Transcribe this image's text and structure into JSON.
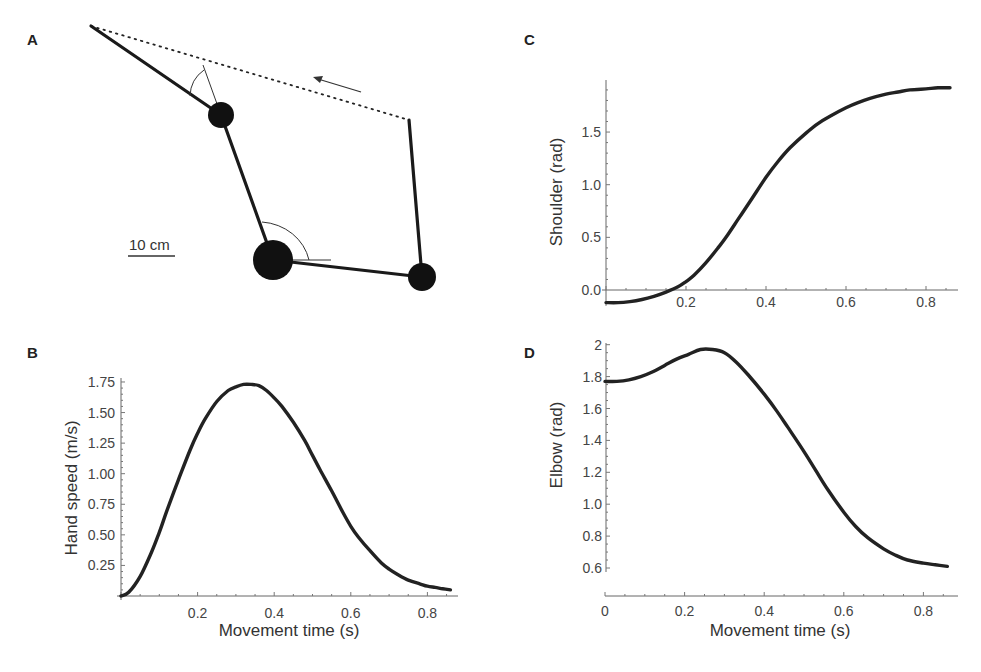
{
  "figure": {
    "panels": {
      "A": {
        "label": "A",
        "scale_bar_label": "10 cm",
        "hand_start": [
          409,
          120
        ],
        "hand_end": [
          91,
          26
        ],
        "initial_arm": {
          "shoulder": [
            273,
            260
          ],
          "elbow": [
            422,
            277
          ],
          "hand": [
            409,
            120
          ]
        },
        "final_arm": {
          "shoulder": [
            273,
            260
          ],
          "elbow": [
            221,
            115
          ],
          "hand": [
            91,
            26
          ]
        },
        "movement_arrow": {
          "from": [
            361,
            92
          ],
          "to": [
            314,
            78
          ]
        },
        "joint_radii": {
          "shoulder": 20,
          "elbow_final": 13,
          "elbow_initial": 14
        }
      },
      "B": {
        "label": "B"
      },
      "C": {
        "label": "C"
      },
      "D": {
        "label": "D"
      }
    }
  },
  "chart_data": [
    {
      "panel": "A",
      "type": "diagram",
      "title": "Two-link arm reaching movement",
      "annotations": [
        "10 cm scale bar",
        "dotted hand path",
        "arrow indicating movement direction",
        "shoulder angle arc",
        "elbow angle arc"
      ]
    },
    {
      "panel": "B",
      "type": "line",
      "title": "",
      "xlabel": "Movement time (s)",
      "ylabel": "Hand speed (m/s)",
      "xticks": [
        "0.2",
        "0.4",
        "0.6",
        "0.8"
      ],
      "yticks": [
        "0.25",
        "0.50",
        "0.75",
        "1.00",
        "1.25",
        "1.50",
        "1.75"
      ],
      "xlim": [
        0,
        0.88
      ],
      "ylim": [
        0,
        1.75
      ],
      "grid": false,
      "series": [
        {
          "name": "Hand speed",
          "x": [
            0,
            0.02,
            0.05,
            0.08,
            0.1,
            0.12,
            0.15,
            0.18,
            0.2,
            0.22,
            0.25,
            0.28,
            0.3,
            0.32,
            0.34,
            0.36,
            0.38,
            0.4,
            0.42,
            0.45,
            0.48,
            0.5,
            0.52,
            0.55,
            0.58,
            0.6,
            0.62,
            0.65,
            0.68,
            0.7,
            0.72,
            0.75,
            0.78,
            0.8,
            0.82,
            0.84,
            0.86
          ],
          "values": [
            0,
            0.03,
            0.16,
            0.36,
            0.52,
            0.7,
            0.95,
            1.19,
            1.33,
            1.45,
            1.59,
            1.68,
            1.71,
            1.73,
            1.73,
            1.72,
            1.68,
            1.62,
            1.55,
            1.42,
            1.27,
            1.15,
            1.03,
            0.86,
            0.68,
            0.57,
            0.48,
            0.37,
            0.27,
            0.22,
            0.18,
            0.13,
            0.1,
            0.08,
            0.07,
            0.06,
            0.05
          ]
        }
      ]
    },
    {
      "panel": "C",
      "type": "line",
      "title": "",
      "xlabel": "",
      "ylabel": "Shoulder (rad)",
      "xticks": [
        "0.2",
        "0.4",
        "0.6",
        "0.8"
      ],
      "yticks": [
        "0.0",
        "0.5",
        "1.0",
        "1.5"
      ],
      "xlim": [
        0,
        0.88
      ],
      "ylim": [
        -0.15,
        2.0
      ],
      "grid": false,
      "series": [
        {
          "name": "Shoulder angle",
          "x": [
            0,
            0.03,
            0.06,
            0.09,
            0.12,
            0.15,
            0.18,
            0.2,
            0.22,
            0.25,
            0.28,
            0.3,
            0.33,
            0.36,
            0.4,
            0.43,
            0.46,
            0.5,
            0.53,
            0.56,
            0.6,
            0.63,
            0.66,
            0.7,
            0.73,
            0.76,
            0.8,
            0.83,
            0.86
          ],
          "values": [
            -0.12,
            -0.12,
            -0.11,
            -0.09,
            -0.06,
            -0.02,
            0.03,
            0.08,
            0.14,
            0.26,
            0.4,
            0.5,
            0.67,
            0.84,
            1.07,
            1.22,
            1.35,
            1.49,
            1.58,
            1.65,
            1.73,
            1.78,
            1.82,
            1.86,
            1.88,
            1.9,
            1.91,
            1.92,
            1.92
          ]
        }
      ]
    },
    {
      "panel": "D",
      "type": "line",
      "title": "",
      "xlabel": "Movement time (s)",
      "ylabel": "Elbow (rad)",
      "xticks": [
        "0",
        "0.2",
        "0.4",
        "0.6",
        "0.8"
      ],
      "yticks": [
        "0.6",
        "0.8",
        "1.0",
        "1.2",
        "1.4",
        "1.6",
        "1.8",
        "2"
      ],
      "xlim": [
        0,
        0.88
      ],
      "ylim": [
        0.58,
        2.0
      ],
      "grid": false,
      "series": [
        {
          "name": "Elbow angle",
          "x": [
            0,
            0.03,
            0.06,
            0.09,
            0.12,
            0.15,
            0.18,
            0.21,
            0.24,
            0.27,
            0.3,
            0.33,
            0.36,
            0.4,
            0.43,
            0.46,
            0.5,
            0.53,
            0.56,
            0.6,
            0.63,
            0.66,
            0.7,
            0.73,
            0.76,
            0.8,
            0.83,
            0.86
          ],
          "values": [
            1.77,
            1.77,
            1.78,
            1.8,
            1.83,
            1.87,
            1.91,
            1.94,
            1.97,
            1.97,
            1.95,
            1.89,
            1.81,
            1.69,
            1.59,
            1.48,
            1.33,
            1.21,
            1.09,
            0.95,
            0.86,
            0.79,
            0.72,
            0.68,
            0.65,
            0.63,
            0.62,
            0.61
          ]
        }
      ]
    }
  ],
  "layout": {
    "B": {
      "x0": 121,
      "px_per_x": 383,
      "y0": 596,
      "px_per_y": 122.3,
      "axis_x_end": 458,
      "axis_y_top": 378
    },
    "C": {
      "x0": 606,
      "px_per_x": 400,
      "y0": 290,
      "px_per_y": 105.3,
      "axis_x_end": 958,
      "axis_y_top": 80
    },
    "D": {
      "x0": 605,
      "px_per_x": 398,
      "y_ref": 0.6,
      "y_ref_px": 568,
      "px_per_y": 159.5,
      "axis_x_y": 596,
      "axis_x_end": 958,
      "axis_y_top": 343,
      "axis_y_bottom": 572
    }
  },
  "colors": {
    "curve": "#222222",
    "axis": "#666666",
    "text": "#444444"
  }
}
